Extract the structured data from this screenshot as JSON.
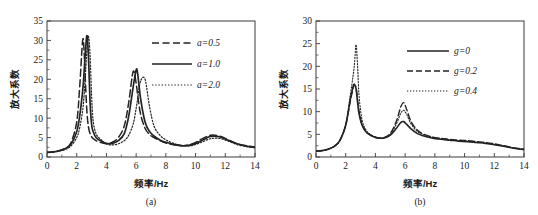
{
  "figure": {
    "background": "#ffffff",
    "ink_color": "#232323"
  },
  "chart_data": [
    {
      "type": "line",
      "panel_id": "a",
      "caption": "(a)",
      "title": "",
      "xlabel": "频率/Hz",
      "ylabel": "放大系数",
      "xlim": [
        0,
        14
      ],
      "ylim": [
        0,
        35
      ],
      "xticks": [
        0,
        2,
        4,
        6,
        8,
        10,
        12,
        14
      ],
      "yticks": [
        0,
        5,
        10,
        15,
        20,
        25,
        30,
        35
      ],
      "xtick_labels": [
        "0",
        "2",
        "4",
        "6",
        "8",
        "10",
        "12",
        "14"
      ],
      "ytick_labels": [
        "0",
        "5",
        "10",
        "15",
        "20",
        "25",
        "30",
        "35"
      ],
      "grid": false,
      "legend_position": "upper-right",
      "x": [
        0.0,
        0.4,
        0.8,
        1.2,
        1.6,
        2.0,
        2.2,
        2.4,
        2.5,
        2.6,
        2.7,
        2.8,
        2.9,
        3.0,
        3.1,
        3.3,
        3.6,
        4.0,
        4.4,
        4.8,
        5.2,
        5.5,
        5.8,
        6.0,
        6.1,
        6.3,
        6.6,
        6.9,
        7.2,
        7.6,
        8.0,
        8.6,
        9.2,
        9.8,
        10.4,
        11.0,
        11.6,
        12.2,
        12.8,
        13.4,
        14.0
      ],
      "series": [
        {
          "name": "a=0.5",
          "label": "a=0.5",
          "style": "dashed",
          "dash": "7,3.5",
          "width": 1.5,
          "values": [
            1.2,
            1.3,
            1.6,
            2.2,
            3.6,
            9.0,
            18.0,
            30.0,
            27.0,
            18.0,
            11.0,
            7.5,
            6.0,
            5.2,
            4.8,
            4.2,
            3.8,
            3.4,
            3.8,
            5.0,
            8.0,
            14.0,
            22.0,
            19.0,
            16.0,
            11.0,
            7.4,
            5.8,
            5.0,
            4.2,
            3.6,
            3.1,
            2.9,
            3.4,
            4.6,
            5.6,
            5.4,
            4.4,
            3.4,
            2.9,
            2.6
          ]
        },
        {
          "name": "a=1.0",
          "label": "a=1.0",
          "style": "solid",
          "dash": "none",
          "width": 1.7,
          "values": [
            1.2,
            1.3,
            1.6,
            2.1,
            3.2,
            6.5,
            10.5,
            17.0,
            22.0,
            28.0,
            31.2,
            25.0,
            14.0,
            8.5,
            6.6,
            5.0,
            4.2,
            3.5,
            3.5,
            4.2,
            6.0,
            10.5,
            18.0,
            22.4,
            21.5,
            15.0,
            9.0,
            6.6,
            5.4,
            4.4,
            3.8,
            3.2,
            2.9,
            3.2,
            4.2,
            5.3,
            5.2,
            4.3,
            3.4,
            2.8,
            2.5
          ]
        },
        {
          "name": "a=2.0",
          "label": "a=2.0",
          "style": "dotted",
          "dash": "1.4,1.8",
          "width": 1.2,
          "values": [
            1.2,
            1.25,
            1.5,
            1.9,
            2.8,
            5.0,
            7.5,
            12.0,
            16.0,
            22.0,
            28.5,
            31.0,
            26.0,
            16.0,
            9.5,
            6.0,
            4.6,
            3.4,
            3.1,
            3.4,
            4.2,
            5.6,
            8.5,
            12.5,
            15.0,
            19.5,
            20.0,
            13.0,
            8.0,
            5.6,
            4.4,
            3.4,
            2.9,
            3.0,
            3.8,
            4.7,
            4.8,
            4.1,
            3.2,
            2.7,
            2.4
          ]
        }
      ]
    },
    {
      "type": "line",
      "panel_id": "b",
      "caption": "(b)",
      "title": "",
      "xlabel": "频率/Hz",
      "ylabel": "放大系数",
      "xlim": [
        0,
        14
      ],
      "ylim": [
        0,
        30
      ],
      "xticks": [
        0,
        2,
        4,
        6,
        8,
        10,
        12,
        14
      ],
      "yticks": [
        0,
        5,
        10,
        15,
        20,
        25,
        30
      ],
      "xtick_labels": [
        "0",
        "2",
        "4",
        "6",
        "8",
        "10",
        "12",
        "14"
      ],
      "ytick_labels": [
        "0",
        "5",
        "10",
        "15",
        "20",
        "25",
        "30"
      ],
      "grid": false,
      "legend_position": "upper-right",
      "x": [
        0.0,
        0.4,
        0.8,
        1.2,
        1.6,
        2.0,
        2.3,
        2.5,
        2.6,
        2.7,
        2.8,
        2.9,
        3.1,
        3.4,
        3.8,
        4.2,
        4.6,
        5.0,
        5.4,
        5.7,
        5.9,
        6.1,
        6.4,
        6.8,
        7.2,
        7.8,
        8.4,
        9.0,
        9.6,
        10.2,
        10.8,
        11.4,
        12.0,
        12.6,
        13.2,
        14.0
      ],
      "series": [
        {
          "name": "g=0",
          "label": "g=0",
          "style": "solid",
          "dash": "none",
          "width": 1.6,
          "values": [
            1.3,
            1.4,
            1.7,
            2.3,
            3.6,
            7.0,
            12.5,
            15.6,
            16.0,
            15.0,
            12.0,
            9.5,
            7.0,
            5.4,
            4.6,
            4.2,
            4.2,
            4.8,
            6.3,
            7.6,
            7.8,
            7.2,
            6.2,
            5.2,
            4.7,
            4.2,
            3.9,
            3.7,
            3.5,
            3.4,
            3.2,
            3.0,
            2.7,
            2.4,
            2.0,
            1.6
          ]
        },
        {
          "name": "g=0.2",
          "label": "g=0.2",
          "style": "dashed",
          "dash": "6,3",
          "width": 1.4,
          "values": [
            1.3,
            1.4,
            1.7,
            2.3,
            3.6,
            7.0,
            12.2,
            15.2,
            15.8,
            15.2,
            12.6,
            10.0,
            7.2,
            5.5,
            4.6,
            4.2,
            4.3,
            5.2,
            7.8,
            11.0,
            12.0,
            10.5,
            7.8,
            6.0,
            5.1,
            4.4,
            4.1,
            3.9,
            3.7,
            3.6,
            3.4,
            3.2,
            2.9,
            2.5,
            2.1,
            1.7
          ]
        },
        {
          "name": "g=0.4",
          "label": "g=0.4",
          "style": "dotted",
          "dash": "1.3,1.7",
          "width": 1.1,
          "values": [
            1.3,
            1.4,
            1.7,
            2.3,
            3.6,
            7.2,
            13.5,
            18.0,
            21.0,
            24.8,
            20.0,
            13.5,
            8.2,
            5.8,
            4.7,
            4.2,
            4.3,
            5.0,
            7.2,
            9.6,
            10.3,
            9.4,
            7.3,
            5.7,
            5.0,
            4.4,
            4.1,
            3.8,
            3.6,
            3.5,
            3.3,
            3.1,
            2.8,
            2.5,
            2.1,
            1.7
          ]
        }
      ]
    }
  ]
}
